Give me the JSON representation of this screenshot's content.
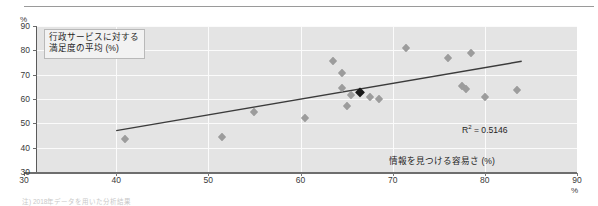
{
  "chart_data": {
    "type": "scatter",
    "title": "",
    "xlabel": "情報を見つける容易さ (%)",
    "ylabel": "行政サービスに対する\n満足度の平均 (%)",
    "xlim": [
      30,
      90
    ],
    "ylim": [
      30,
      90
    ],
    "xticks": [
      "30",
      "40",
      "50",
      "60",
      "70",
      "80",
      "90"
    ],
    "yticks": [
      "30",
      "40",
      "50",
      "60",
      "70",
      "80",
      "90"
    ],
    "x_unit_label": "%",
    "y_unit_label": "%",
    "grid": true,
    "legend": null,
    "annotations": [
      {
        "name": "r-squared",
        "text": "R² = 0.5146",
        "r2": 0.5146
      }
    ],
    "points": [
      {
        "x": 41.0,
        "y": 43.5,
        "highlight": false
      },
      {
        "x": 51.5,
        "y": 44.5,
        "highlight": false
      },
      {
        "x": 55.0,
        "y": 54.5,
        "highlight": false
      },
      {
        "x": 60.5,
        "y": 52.0,
        "highlight": false
      },
      {
        "x": 63.5,
        "y": 75.5,
        "highlight": false
      },
      {
        "x": 64.5,
        "y": 70.5,
        "highlight": false
      },
      {
        "x": 64.5,
        "y": 64.5,
        "highlight": false
      },
      {
        "x": 65.0,
        "y": 57.0,
        "highlight": false
      },
      {
        "x": 65.5,
        "y": 61.5,
        "highlight": false
      },
      {
        "x": 66.5,
        "y": 63.0,
        "highlight": true
      },
      {
        "x": 67.5,
        "y": 61.0,
        "highlight": false
      },
      {
        "x": 68.5,
        "y": 60.0,
        "highlight": false
      },
      {
        "x": 71.5,
        "y": 81.0,
        "highlight": false
      },
      {
        "x": 76.0,
        "y": 77.0,
        "highlight": false
      },
      {
        "x": 77.5,
        "y": 65.5,
        "highlight": false
      },
      {
        "x": 78.0,
        "y": 64.0,
        "highlight": false
      },
      {
        "x": 78.5,
        "y": 79.0,
        "highlight": false
      },
      {
        "x": 80.0,
        "y": 61.0,
        "highlight": false
      },
      {
        "x": 83.5,
        "y": 63.5,
        "highlight": false
      }
    ],
    "trendline": {
      "x0": 40.0,
      "y0": 47.0,
      "x1": 84.0,
      "y1": 75.5
    }
  },
  "footnote": "注) 2018年データを用いた分析結果"
}
